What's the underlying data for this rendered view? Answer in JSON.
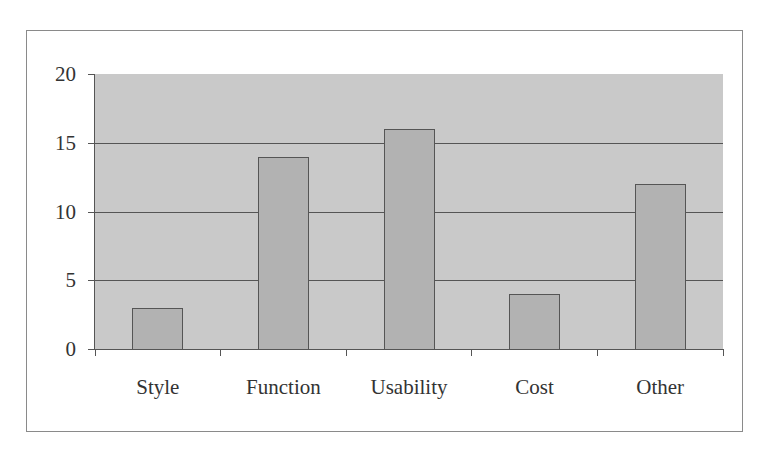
{
  "chart_data": {
    "type": "bar",
    "title": "",
    "xlabel": "",
    "ylabel": "",
    "categories": [
      "Style",
      "Function",
      "Usability",
      "Cost",
      "Other"
    ],
    "values": [
      3,
      14,
      16,
      4,
      12
    ],
    "ylim": [
      0,
      20
    ],
    "yticks": [
      0,
      5,
      10,
      15,
      20
    ],
    "grid": true,
    "legend": null,
    "colors": {
      "plot_background": "#c9c9c9",
      "bar_fill": "#b2b2b2",
      "bar_outline": "#555555",
      "gridline": "#555555"
    }
  },
  "axis": {
    "y_tick_labels": [
      "0",
      "5",
      "10",
      "15",
      "20"
    ],
    "x_tick_labels": [
      "Style",
      "Function",
      "Usability",
      "Cost",
      "Other"
    ]
  }
}
